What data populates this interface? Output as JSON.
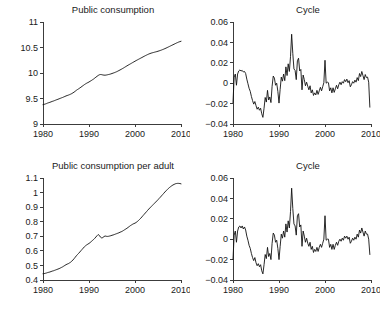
{
  "figure": {
    "background": "#ffffff",
    "ink_color": "#111111",
    "axis_color": "#3c3c3c",
    "panel_count": 4
  },
  "chart_data": [
    {
      "id": "public-consumption-level",
      "panel": "top-left",
      "type": "line",
      "title": "Public consumption",
      "xlabel": "",
      "ylabel": "",
      "xlim": [
        1980,
        2010
      ],
      "ylim": [
        9,
        11
      ],
      "xticks": [
        1980,
        1990,
        2000,
        2010
      ],
      "xticklabels": [
        "1980",
        "1990",
        "2000",
        "2010"
      ],
      "yticks": [
        9,
        9.5,
        10,
        10.5,
        11
      ],
      "yticklabels": [
        "9",
        "9.5",
        "10",
        "10.5",
        "11"
      ],
      "grid": false,
      "legend": "none",
      "x": [
        1980.0,
        1980.25,
        1980.5,
        1980.75,
        1981.0,
        1981.25,
        1981.5,
        1981.75,
        1982.0,
        1982.25,
        1982.5,
        1982.75,
        1983.0,
        1983.25,
        1983.5,
        1983.75,
        1984.0,
        1984.25,
        1984.5,
        1984.75,
        1985.0,
        1985.25,
        1985.5,
        1985.75,
        1986.0,
        1986.25,
        1986.5,
        1986.75,
        1987.0,
        1987.25,
        1987.5,
        1987.75,
        1988.0,
        1988.25,
        1988.5,
        1988.75,
        1989.0,
        1989.25,
        1989.5,
        1989.75,
        1990.0,
        1990.25,
        1990.5,
        1990.75,
        1991.0,
        1991.25,
        1991.5,
        1991.75,
        1992.0,
        1992.25,
        1992.5,
        1992.75,
        1993.0,
        1993.25,
        1993.5,
        1993.75,
        1994.0,
        1994.25,
        1994.5,
        1994.75,
        1995.0,
        1995.25,
        1995.5,
        1995.75,
        1996.0,
        1996.25,
        1996.5,
        1996.75,
        1997.0,
        1997.25,
        1997.5,
        1997.75,
        1998.0,
        1998.25,
        1998.5,
        1998.75,
        1999.0,
        1999.25,
        1999.5,
        1999.75,
        2000.0,
        2000.25,
        2000.5,
        2000.75,
        2001.0,
        2001.25,
        2001.5,
        2001.75,
        2002.0,
        2002.25,
        2002.5,
        2002.75,
        2003.0,
        2003.25,
        2003.5,
        2003.75,
        2004.0,
        2004.25,
        2004.5,
        2004.75,
        2005.0,
        2005.25,
        2005.5,
        2005.75,
        2006.0,
        2006.25,
        2006.5,
        2006.75,
        2007.0,
        2007.25,
        2007.5,
        2007.75,
        2008.0,
        2008.25,
        2008.5,
        2008.75,
        2009.0,
        2009.25,
        2009.5,
        2009.75,
        2010.0
      ],
      "y": [
        9.38,
        9.385,
        9.392,
        9.4,
        9.41,
        9.418,
        9.425,
        9.434,
        9.443,
        9.45,
        9.459,
        9.468,
        9.477,
        9.485,
        9.494,
        9.503,
        9.512,
        9.52,
        9.53,
        9.54,
        9.55,
        9.558,
        9.566,
        9.575,
        9.585,
        9.596,
        9.61,
        9.625,
        9.642,
        9.66,
        9.676,
        9.69,
        9.706,
        9.722,
        9.739,
        9.755,
        9.772,
        9.787,
        9.8,
        9.812,
        9.824,
        9.838,
        9.852,
        9.867,
        9.882,
        9.9,
        9.918,
        9.935,
        9.952,
        9.965,
        9.97,
        9.968,
        9.962,
        9.958,
        9.957,
        9.96,
        9.965,
        9.97,
        9.975,
        9.982,
        9.99,
        9.998,
        10.006,
        10.015,
        10.025,
        10.036,
        10.048,
        10.06,
        10.072,
        10.085,
        10.098,
        10.112,
        10.126,
        10.14,
        10.153,
        10.166,
        10.179,
        10.192,
        10.205,
        10.218,
        10.231,
        10.244,
        10.256,
        10.268,
        10.28,
        10.292,
        10.304,
        10.316,
        10.328,
        10.34,
        10.351,
        10.362,
        10.372,
        10.381,
        10.389,
        10.396,
        10.402,
        10.408,
        10.414,
        10.42,
        10.427,
        10.434,
        10.442,
        10.45,
        10.459,
        10.468,
        10.478,
        10.488,
        10.499,
        10.51,
        10.521,
        10.532,
        10.543,
        10.554,
        10.565,
        10.576,
        10.587,
        10.597,
        10.607,
        10.615,
        10.622
      ]
    },
    {
      "id": "public-consumption-cycle",
      "panel": "top-right",
      "type": "line",
      "title": "Cycle",
      "xlabel": "",
      "ylabel": "",
      "xlim": [
        1980,
        2010
      ],
      "ylim": [
        -0.04,
        0.06
      ],
      "xticks": [
        1980,
        1990,
        2000,
        2010
      ],
      "xticklabels": [
        "1980",
        "1990",
        "2000",
        "2010"
      ],
      "yticks": [
        -0.04,
        -0.02,
        0,
        0.02,
        0.04,
        0.06
      ],
      "yticklabels": [
        "-0.04",
        "-0.02",
        "0",
        "0.02",
        "0.04",
        "0.06"
      ],
      "grid": false,
      "legend": "none",
      "x": [
        1980.0,
        1980.25,
        1980.5,
        1980.75,
        1981.0,
        1981.25,
        1981.5,
        1981.75,
        1982.0,
        1982.25,
        1982.5,
        1982.75,
        1983.0,
        1983.25,
        1983.5,
        1983.75,
        1984.0,
        1984.25,
        1984.5,
        1984.75,
        1985.0,
        1985.25,
        1985.5,
        1985.75,
        1986.0,
        1986.25,
        1986.5,
        1986.75,
        1987.0,
        1987.25,
        1987.5,
        1987.75,
        1988.0,
        1988.25,
        1988.5,
        1988.75,
        1989.0,
        1989.25,
        1989.5,
        1989.75,
        1990.0,
        1990.25,
        1990.5,
        1990.75,
        1991.0,
        1991.25,
        1991.5,
        1991.75,
        1992.0,
        1992.25,
        1992.5,
        1992.75,
        1993.0,
        1993.25,
        1993.5,
        1993.75,
        1994.0,
        1994.25,
        1994.5,
        1994.75,
        1995.0,
        1995.25,
        1995.5,
        1995.75,
        1996.0,
        1996.25,
        1996.5,
        1996.75,
        1997.0,
        1997.25,
        1997.5,
        1997.75,
        1998.0,
        1998.25,
        1998.5,
        1998.75,
        1999.0,
        1999.25,
        1999.5,
        1999.75,
        2000.0,
        2000.25,
        2000.5,
        2000.75,
        2001.0,
        2001.25,
        2001.5,
        2001.75,
        2002.0,
        2002.25,
        2002.5,
        2002.75,
        2003.0,
        2003.25,
        2003.5,
        2003.75,
        2004.0,
        2004.25,
        2004.5,
        2004.75,
        2005.0,
        2005.25,
        2005.5,
        2005.75,
        2006.0,
        2006.25,
        2006.5,
        2006.75,
        2007.0,
        2007.25,
        2007.5,
        2007.75,
        2008.0,
        2008.25,
        2008.5,
        2008.75,
        2009.0,
        2009.25,
        2009.5,
        2009.75,
        2010.0
      ],
      "y": [
        -0.019,
        0.006,
        0.009,
        -0.002,
        0.009,
        0.012,
        0.013,
        0.012,
        0.0125,
        0.011,
        0.0115,
        0.0095,
        0.004,
        -0.0005,
        -0.005,
        -0.008,
        -0.013,
        -0.017,
        -0.0205,
        -0.018,
        -0.022,
        -0.0255,
        -0.0235,
        -0.0265,
        -0.0245,
        -0.03,
        -0.0335,
        -0.0245,
        -0.014,
        -0.0185,
        -0.007,
        -0.0165,
        -0.0135,
        -0.019,
        -0.003,
        0.007,
        0.005,
        -0.002,
        0.0,
        -0.008,
        -0.0195,
        -0.006,
        0.006,
        0.002,
        0.009,
        0.0025,
        0.016,
        0.0075,
        0.019,
        0.0115,
        0.026,
        0.048,
        0.029,
        0.014,
        0.0125,
        0.0035,
        0.022,
        0.0245,
        0.012,
        0.0135,
        -0.0065,
        0.008,
        0.0035,
        -0.0025,
        0.001,
        -0.003,
        -0.0065,
        -0.0025,
        -0.0095,
        -0.0065,
        -0.012,
        -0.0095,
        -0.0115,
        -0.007,
        -0.011,
        -0.0075,
        -0.004,
        -0.0075,
        -0.0035,
        0.0005,
        0.0225,
        0.0,
        0.001,
        0.0005,
        -0.0075,
        -0.0045,
        -0.0095,
        -0.0045,
        -0.009,
        -0.0055,
        -0.002,
        -0.0055,
        -0.0015,
        0.001,
        -0.0015,
        0.0015,
        0.0,
        0.0035,
        0.0015,
        0.004,
        0.0005,
        0.0025,
        -0.0035,
        -0.0015,
        0.0015,
        0.0,
        0.003,
        0.001,
        0.0055,
        0.0025,
        0.0095,
        0.0065,
        0.0115,
        0.0075,
        0.0035,
        0.0085,
        0.0055,
        0.006,
        0.001,
        -0.0235
      ]
    },
    {
      "id": "public-consumption-per-adult-level",
      "panel": "bottom-left",
      "type": "line",
      "title": "Public consumption per adult",
      "xlabel": "",
      "ylabel": "",
      "xlim": [
        1980,
        2010
      ],
      "ylim": [
        0.4,
        1.1
      ],
      "xticks": [
        1980,
        1990,
        2000,
        2010
      ],
      "xticklabels": [
        "1980",
        "1990",
        "2000",
        "2010"
      ],
      "yticks": [
        0.4,
        0.5,
        0.6,
        0.7,
        0.8,
        0.9,
        1.0,
        1.1
      ],
      "yticklabels": [
        "0.4",
        "0.5",
        "0.6",
        "0.7",
        "0.8",
        "0.9",
        "1",
        "1.1"
      ],
      "grid": false,
      "legend": "none",
      "x": [
        1980.0,
        1980.25,
        1980.5,
        1980.75,
        1981.0,
        1981.25,
        1981.5,
        1981.75,
        1982.0,
        1982.25,
        1982.5,
        1982.75,
        1983.0,
        1983.25,
        1983.5,
        1983.75,
        1984.0,
        1984.25,
        1984.5,
        1984.75,
        1985.0,
        1985.25,
        1985.5,
        1985.75,
        1986.0,
        1986.25,
        1986.5,
        1986.75,
        1987.0,
        1987.25,
        1987.5,
        1987.75,
        1988.0,
        1988.25,
        1988.5,
        1988.75,
        1989.0,
        1989.25,
        1989.5,
        1989.75,
        1990.0,
        1990.25,
        1990.5,
        1990.75,
        1991.0,
        1991.25,
        1991.5,
        1991.75,
        1992.0,
        1992.25,
        1992.5,
        1992.75,
        1993.0,
        1993.25,
        1993.5,
        1993.75,
        1994.0,
        1994.25,
        1994.5,
        1994.75,
        1995.0,
        1995.25,
        1995.5,
        1995.75,
        1996.0,
        1996.25,
        1996.5,
        1996.75,
        1997.0,
        1997.25,
        1997.5,
        1997.75,
        1998.0,
        1998.25,
        1998.5,
        1998.75,
        1999.0,
        1999.25,
        1999.5,
        1999.75,
        2000.0,
        2000.25,
        2000.5,
        2000.75,
        2001.0,
        2001.25,
        2001.5,
        2001.75,
        2002.0,
        2002.25,
        2002.5,
        2002.75,
        2003.0,
        2003.25,
        2003.5,
        2003.75,
        2004.0,
        2004.25,
        2004.5,
        2004.75,
        2005.0,
        2005.25,
        2005.5,
        2005.75,
        2006.0,
        2006.25,
        2006.5,
        2006.75,
        2007.0,
        2007.25,
        2007.5,
        2007.75,
        2008.0,
        2008.25,
        2008.5,
        2008.75,
        2009.0,
        2009.25,
        2009.5,
        2009.75,
        2010.0
      ],
      "y": [
        0.443,
        0.444,
        0.446,
        0.448,
        0.451,
        0.453,
        0.455,
        0.458,
        0.461,
        0.463,
        0.466,
        0.469,
        0.472,
        0.475,
        0.478,
        0.482,
        0.486,
        0.49,
        0.495,
        0.5,
        0.505,
        0.509,
        0.512,
        0.517,
        0.522,
        0.529,
        0.537,
        0.546,
        0.556,
        0.566,
        0.575,
        0.583,
        0.592,
        0.601,
        0.61,
        0.619,
        0.628,
        0.635,
        0.641,
        0.646,
        0.651,
        0.657,
        0.664,
        0.671,
        0.678,
        0.686,
        0.695,
        0.704,
        0.712,
        0.706,
        0.694,
        0.689,
        0.691,
        0.698,
        0.702,
        0.7,
        0.699,
        0.7,
        0.702,
        0.704,
        0.707,
        0.709,
        0.712,
        0.715,
        0.718,
        0.721,
        0.724,
        0.728,
        0.731,
        0.735,
        0.74,
        0.745,
        0.75,
        0.755,
        0.761,
        0.767,
        0.773,
        0.778,
        0.783,
        0.787,
        0.79,
        0.795,
        0.801,
        0.808,
        0.816,
        0.824,
        0.833,
        0.842,
        0.851,
        0.86,
        0.869,
        0.878,
        0.887,
        0.895,
        0.903,
        0.911,
        0.919,
        0.927,
        0.935,
        0.943,
        0.951,
        0.96,
        0.968,
        0.977,
        0.986,
        0.995,
        1.004,
        1.012,
        1.02,
        1.028,
        1.035,
        1.041,
        1.047,
        1.052,
        1.056,
        1.06,
        1.062,
        1.063,
        1.063,
        1.062,
        1.06
      ]
    },
    {
      "id": "public-consumption-per-adult-cycle",
      "panel": "bottom-right",
      "type": "line",
      "title": "Cycle",
      "xlabel": "",
      "ylabel": "",
      "xlim": [
        1980,
        2010
      ],
      "ylim": [
        -0.04,
        0.06
      ],
      "xticks": [
        1980,
        1990,
        2000,
        2010
      ],
      "xticklabels": [
        "1980",
        "1990",
        "2000",
        "2010"
      ],
      "yticks": [
        -0.04,
        -0.02,
        0,
        0.02,
        0.04,
        0.06
      ],
      "yticklabels": [
        "-0.04",
        "-0.02",
        "0",
        "0.02",
        "0.04",
        "0.06"
      ],
      "grid": false,
      "legend": "none",
      "x": [
        1980.0,
        1980.25,
        1980.5,
        1980.75,
        1981.0,
        1981.25,
        1981.5,
        1981.75,
        1982.0,
        1982.25,
        1982.5,
        1982.75,
        1983.0,
        1983.25,
        1983.5,
        1983.75,
        1984.0,
        1984.25,
        1984.5,
        1984.75,
        1985.0,
        1985.25,
        1985.5,
        1985.75,
        1986.0,
        1986.25,
        1986.5,
        1986.75,
        1987.0,
        1987.25,
        1987.5,
        1987.75,
        1988.0,
        1988.25,
        1988.5,
        1988.75,
        1989.0,
        1989.25,
        1989.5,
        1989.75,
        1990.0,
        1990.25,
        1990.5,
        1990.75,
        1991.0,
        1991.25,
        1991.5,
        1991.75,
        1992.0,
        1992.25,
        1992.5,
        1992.75,
        1993.0,
        1993.25,
        1993.5,
        1993.75,
        1994.0,
        1994.25,
        1994.5,
        1994.75,
        1995.0,
        1995.25,
        1995.5,
        1995.75,
        1996.0,
        1996.25,
        1996.5,
        1996.75,
        1997.0,
        1997.25,
        1997.5,
        1997.75,
        1998.0,
        1998.25,
        1998.5,
        1998.75,
        1999.0,
        1999.25,
        1999.5,
        1999.75,
        2000.0,
        2000.25,
        2000.5,
        2000.75,
        2001.0,
        2001.25,
        2001.5,
        2001.75,
        2002.0,
        2002.25,
        2002.5,
        2002.75,
        2003.0,
        2003.25,
        2003.5,
        2003.75,
        2004.0,
        2004.25,
        2004.5,
        2004.75,
        2005.0,
        2005.25,
        2005.5,
        2005.75,
        2006.0,
        2006.25,
        2006.5,
        2006.75,
        2007.0,
        2007.25,
        2007.5,
        2007.75,
        2008.0,
        2008.25,
        2008.5,
        2008.75,
        2009.0,
        2009.25,
        2009.5,
        2009.75,
        2010.0
      ],
      "y": [
        -0.02,
        0.004,
        0.008,
        -0.003,
        0.008,
        0.012,
        0.013,
        0.011,
        0.013,
        0.01,
        0.012,
        0.009,
        0.003,
        -0.001,
        -0.006,
        -0.009,
        -0.014,
        -0.018,
        -0.021,
        -0.018,
        -0.023,
        -0.026,
        -0.024,
        -0.027,
        -0.025,
        -0.031,
        -0.034,
        -0.025,
        -0.015,
        -0.019,
        -0.008,
        -0.017,
        -0.014,
        -0.02,
        -0.004,
        0.006,
        0.004,
        -0.003,
        -0.001,
        -0.009,
        -0.02,
        -0.007,
        0.005,
        0.001,
        0.008,
        0.002,
        0.015,
        0.007,
        0.018,
        0.011,
        0.027,
        0.05,
        0.03,
        0.015,
        0.013,
        0.004,
        0.023,
        0.025,
        0.012,
        0.014,
        -0.007,
        0.008,
        0.003,
        -0.003,
        0.001,
        -0.004,
        -0.007,
        -0.003,
        -0.01,
        -0.007,
        -0.013,
        -0.01,
        -0.012,
        -0.008,
        -0.012,
        -0.008,
        -0.005,
        -0.008,
        -0.004,
        0.0,
        0.023,
        -0.001,
        0.0,
        0.0,
        -0.008,
        -0.005,
        -0.01,
        -0.005,
        -0.01,
        -0.006,
        -0.003,
        -0.006,
        -0.002,
        0.0,
        -0.002,
        0.001,
        -0.001,
        0.003,
        0.001,
        0.003,
        0.0,
        0.002,
        -0.004,
        -0.002,
        0.001,
        -0.001,
        0.002,
        0.0,
        0.005,
        0.002,
        0.009,
        0.006,
        0.011,
        0.007,
        0.003,
        0.008,
        0.005,
        0.005,
        0.0,
        -0.015
      ]
    }
  ]
}
